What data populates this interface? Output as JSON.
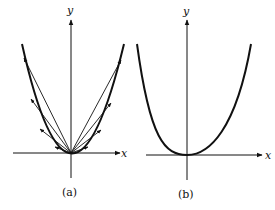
{
  "panels": [
    {
      "id": "a",
      "caption": "(a)",
      "x_label": "x",
      "y_label": "y",
      "description": "Parabola with vectors drawn from the origin to points on the curve"
    },
    {
      "id": "b",
      "caption": "(b)",
      "x_label": "x",
      "y_label": "y",
      "description": "Parabola alone"
    }
  ],
  "colors": {
    "ink": "#111111",
    "background": "#ffffff"
  }
}
